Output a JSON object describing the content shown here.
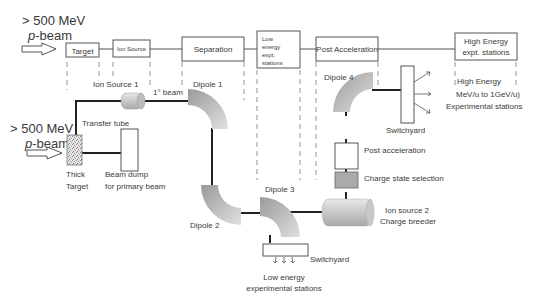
{
  "top_beam": {
    "energy": "> 500 MeV",
    "p": "p",
    "beam": "-beam"
  },
  "stages": [
    {
      "id": "target",
      "label": [
        "Target"
      ]
    },
    {
      "id": "ion-source",
      "label": [
        "Ion Source"
      ]
    },
    {
      "id": "separation",
      "label": [
        "Separation"
      ]
    },
    {
      "id": "low-energy-stations",
      "label": [
        "Low",
        "energy",
        "expt.",
        "stations"
      ]
    },
    {
      "id": "post-acceleration",
      "label": [
        "Post Acceleration"
      ]
    },
    {
      "id": "high-energy-stations",
      "label": [
        "High Energy",
        "expt. stations"
      ]
    }
  ],
  "components": {
    "ion_source_1": "Ion Source 1",
    "primary_beam": "1° beam",
    "dipole_1": "Dipole 1",
    "dipole_2": "Dipole 2",
    "dipole_3": "Dipole 3",
    "dipole_4": "Dipole 4",
    "transfer_tube": "Transfer tube",
    "thick_target": [
      "Thick",
      "Target"
    ],
    "beam_dump": [
      "Beam dump",
      "for primary beam"
    ],
    "switchyard_high": "Switchyard",
    "switchyard_low": "Switchyard",
    "post_acceleration": "Post acceleration",
    "charge_state_selection": "Charge state selection",
    "ion_source_2": [
      "Ion source 2",
      "Charge breeder"
    ],
    "low_energy_stations": [
      "Low energy",
      "experimental stations"
    ],
    "high_energy_stations": [
      "High Energy",
      "MeV/u to 1GeV/u)",
      "Experimental stations"
    ]
  },
  "lower_beam": {
    "energy": "> 500 MeV",
    "p": "p",
    "beam": "-beam"
  }
}
